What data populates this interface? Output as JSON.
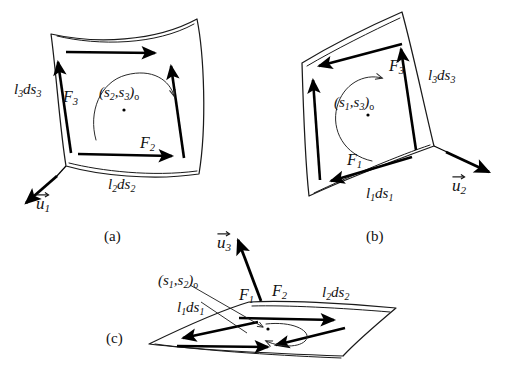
{
  "figure": {
    "background_color": "#ffffff",
    "ink_color": "#111111"
  },
  "panels": [
    {
      "id": "a",
      "caption": "(a)",
      "center_label": "(s",
      "center_sub1": "2",
      "center_sep": ",s",
      "center_sub2": "3",
      "center_suffix": ")",
      "center_suffix_sub": "o",
      "labels": {
        "edge_left": "l",
        "edge_left_sub1": "3",
        "edge_left_mid": "ds",
        "edge_left_sub2": "3",
        "edge_bottom": "l",
        "edge_bottom_sub1": "2",
        "edge_bottom_mid": "ds",
        "edge_bottom_sub2": "2",
        "force_left": "F",
        "force_left_sub": "3",
        "force_bottom": "F",
        "force_bottom_sub": "2",
        "unit_vector": "u",
        "unit_vector_sub": "1"
      }
    },
    {
      "id": "b",
      "caption": "(b)",
      "center_label": "(s",
      "center_sub1": "1",
      "center_sep": ",s",
      "center_sub2": "3",
      "center_suffix": ")",
      "center_suffix_sub": "o",
      "labels": {
        "edge_right": "l",
        "edge_right_sub1": "3",
        "edge_right_mid": "ds",
        "edge_right_sub2": "3",
        "edge_bottom": "l",
        "edge_bottom_sub1": "1",
        "edge_bottom_mid": "ds",
        "edge_bottom_sub2": "1",
        "force_top": "F",
        "force_top_sub": "3",
        "force_bottom": "F",
        "force_bottom_sub": "1",
        "unit_vector": "u",
        "unit_vector_sub": "2"
      }
    },
    {
      "id": "c",
      "caption": "(c)",
      "center_label": "(s",
      "center_sub1": "1",
      "center_sep": ",s",
      "center_sub2": "2",
      "center_suffix": ")",
      "center_suffix_sub": "o",
      "labels": {
        "edge_left": "l",
        "edge_left_sub1": "1",
        "edge_left_mid": "ds",
        "edge_left_sub2": "1",
        "edge_right": "l",
        "edge_right_sub1": "2",
        "edge_right_mid": "ds",
        "edge_right_sub2": "2",
        "force_left": "F",
        "force_left_sub": "1",
        "force_right": "F",
        "force_right_sub": "2",
        "unit_vector": "u",
        "unit_vector_sub": "3"
      }
    }
  ],
  "text": {
    "a_l3ds3": "l3ds3",
    "a_l2ds2": "l2ds2",
    "a_F3": "F3",
    "a_F2": "F2",
    "a_u1": "u1",
    "a_center": "(s2,s3)o",
    "a_caption": "(a)",
    "b_l3ds3": "l3ds3",
    "b_l1ds1": "l1ds1",
    "b_F3": "F3",
    "b_F1": "F1",
    "b_u2": "u2",
    "b_center": "(s1,s3)o",
    "b_caption": "(b)",
    "c_l1ds1": "l1ds1",
    "c_l2ds2": "l2ds2",
    "c_F1": "F1",
    "c_F2": "F2",
    "c_u3": "u3",
    "c_center": "(s1,s2)o",
    "c_caption": "(c)"
  }
}
